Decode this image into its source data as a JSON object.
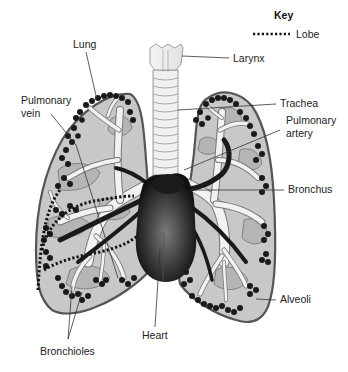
{
  "key": {
    "title": "Key",
    "items": [
      {
        "symbol": "dotted-line",
        "label": "Lobe"
      }
    ]
  },
  "labels": {
    "lung": "Lung",
    "larynx": "Larynx",
    "pulmonary_vein_line1": "Pulmonary",
    "pulmonary_vein_line2": "vein",
    "trachea": "Trachea",
    "pulmonary_artery_line1": "Pulmonary",
    "pulmonary_artery_line2": "artery",
    "bronchus": "Bronchus",
    "alveoli": "Alveoli",
    "heart": "Heart",
    "bronchioles": "Bronchioles"
  },
  "colors": {
    "lung_tissue": "#c8c8c8",
    "lung_outline": "#555555",
    "airway": "#f2f2f2",
    "alveoli": "#1a1a1a",
    "heart": "#2a2a2a",
    "text": "#222222"
  }
}
